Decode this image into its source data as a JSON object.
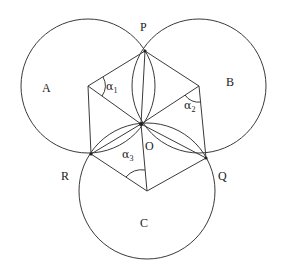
{
  "diagram": {
    "points": {
      "P": {
        "label": "P",
        "x": 145,
        "y": 51
      },
      "Q": {
        "label": "Q",
        "x": 206,
        "y": 158
      },
      "R": {
        "label": "R",
        "x": 91,
        "y": 154
      },
      "O": {
        "label": "O",
        "x": 141,
        "y": 124
      }
    },
    "circles": [
      {
        "name": "A",
        "label": "A",
        "cx": 88,
        "cy": 86,
        "r": 67
      },
      {
        "name": "B",
        "label": "B",
        "cx": 199,
        "cy": 86,
        "r": 67
      },
      {
        "name": "C",
        "label": "C",
        "cx": 147,
        "cy": 191,
        "r": 68
      }
    ],
    "angles": [
      {
        "symbol": "α",
        "subscript": "1",
        "at": "A"
      },
      {
        "symbol": "α",
        "subscript": "2",
        "at": "B"
      },
      {
        "symbol": "α",
        "subscript": "3",
        "at": "C"
      }
    ]
  }
}
